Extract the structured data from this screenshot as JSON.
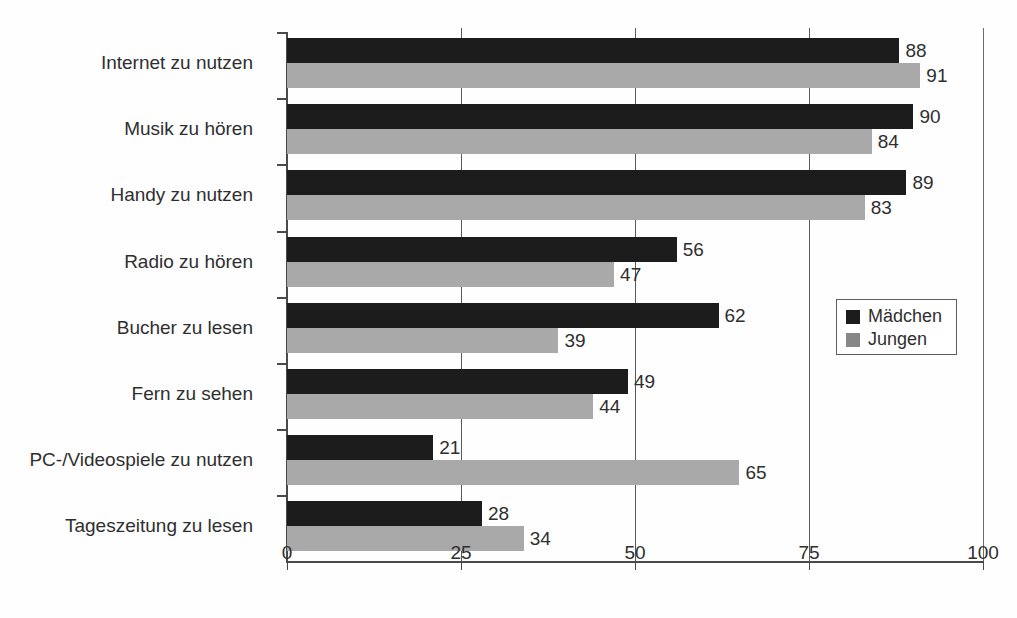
{
  "chart_data": {
    "type": "bar",
    "orientation": "horizontal",
    "title": "",
    "xlabel": "",
    "ylabel": "",
    "xlim": [
      0,
      100
    ],
    "xticks": [
      "0",
      "25",
      "50",
      "75",
      "100"
    ],
    "grid": true,
    "legend_position": "middle-right",
    "categories": [
      "Internet zu nutzen",
      "Musik zu hören",
      "Handy zu nutzen",
      "Radio zu hören",
      "Bucher zu lesen",
      "Fern zu sehen",
      "PC-/Videospiele zu nutzen",
      "Tageszeitung zu lesen"
    ],
    "series": [
      {
        "name": "Mädchen",
        "color": "#1c1c1c",
        "values": [
          88,
          90,
          89,
          56,
          62,
          49,
          21,
          28
        ]
      },
      {
        "name": "Jungen",
        "color": "#a9a9a9",
        "values": [
          91,
          84,
          83,
          47,
          39,
          44,
          65,
          34
        ]
      }
    ]
  },
  "legend": {
    "entries": [
      {
        "label": "Mädchen"
      },
      {
        "label": "Jungen"
      }
    ]
  }
}
